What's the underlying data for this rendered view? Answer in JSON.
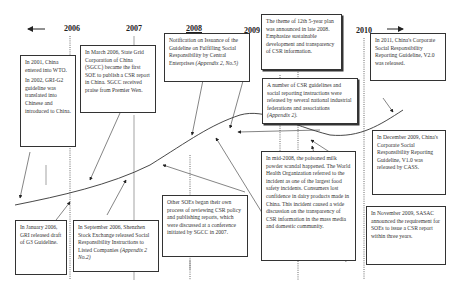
{
  "timeline": {
    "years": [
      "2006",
      "2007",
      "2008",
      "2009",
      "2010"
    ],
    "left_arrow": "arrow-left",
    "right_arrow": "arrow-right"
  },
  "boxes": {
    "wto": {
      "p1": "In 2001, China entered into WTO.",
      "p2": "In 2002, GRI-G2 guideline was translated into Chinese and introduced to China."
    },
    "sgcc": {
      "text": "In March 2006, State Grid Corporation of China (SGCC) became the first SOE to publish a CSR report in China. SGCC received praise from Premier Wen."
    },
    "notification": {
      "text": "Notification on Issuance of the Guideline on Fulfilling Social Responsibility by Central Enterprises",
      "ref": "(Appendix 2, No.5)"
    },
    "five_year": {
      "text": "The theme of 12th 5-year plan was announced in late 2008. Emphasize sustainable development and transparency of CSR information."
    },
    "guideline_v2": {
      "text": "In 2011, China's Corporate Social Responsibility Reporting Guideline, V2.0 was released."
    },
    "federations": {
      "text": "A number of CSR guidelines and social reporting instructions were released by several national industrial federations and associations",
      "ref": "(Appendix 2)."
    },
    "guideline_v1": {
      "text": "In December 2009, China's Corporate Social Responsibility Reporting Guideline, V1.0 was released by CASS."
    },
    "gri_g3": {
      "text": "In January 2006, GRI released draft of G3 Guideline."
    },
    "shenzhen": {
      "text": "In September 2006, Shenzhen Stock Exchange released Social Responsibility Instructions to Listed Companies",
      "ref": "(Appendix 2 No.2)"
    },
    "other_soes": {
      "text": "Other SOEs began their own process of reviewing CSR policy and publishing reports, which were discussed at a conference initiated by SGCC in 2007."
    },
    "milk": {
      "text": "In mid-2008, the poisoned milk powder scandal happened. The World Health Organization referred to the incident as one of the largest food safety incidents. Consumers lost confidence in dairy products made in China. This incident caused a wide discussion on the transparency of CSR information in the mass media and domestic community."
    },
    "sasac": {
      "text": "In November 2009, SASAC announced the requirement for SOEs to issue a CSR report within three years."
    }
  }
}
